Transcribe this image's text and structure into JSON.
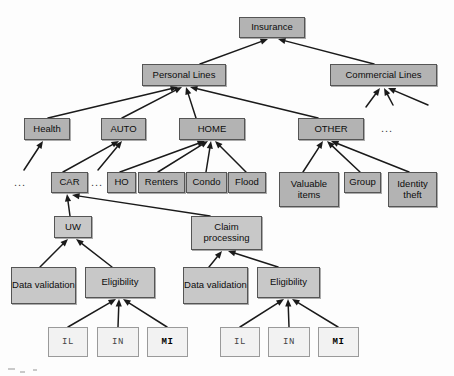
{
  "diagram": {
    "type": "tree-diagram",
    "colors": {
      "node_fill": "#b3b3b3",
      "node_fill_light": "#c8c8c8",
      "state_fill": "#f2f2f2",
      "border": "#555555",
      "edge": "#1a1a1a",
      "background": "#fdfdfd"
    },
    "nodes": [
      {
        "id": "insurance",
        "label": "Insurance",
        "x": 239,
        "y": 17,
        "w": 66,
        "h": 21,
        "shade": "shade-mid",
        "kind": "box"
      },
      {
        "id": "personal",
        "label": "Personal Lines",
        "x": 142,
        "y": 64,
        "w": 84,
        "h": 22,
        "shade": "shade-mid",
        "kind": "box"
      },
      {
        "id": "commercial",
        "label": "Commercial Lines",
        "x": 330,
        "y": 64,
        "w": 107,
        "h": 22,
        "shade": "shade-mid",
        "kind": "box"
      },
      {
        "id": "health",
        "label": "Health",
        "x": 24,
        "y": 118,
        "w": 46,
        "h": 22,
        "shade": "shade-mid",
        "kind": "box"
      },
      {
        "id": "auto",
        "label": "AUTO",
        "x": 101,
        "y": 118,
        "w": 45,
        "h": 22,
        "shade": "shade-mid",
        "kind": "box"
      },
      {
        "id": "home",
        "label": "HOME",
        "x": 179,
        "y": 118,
        "w": 66,
        "h": 22,
        "shade": "shade-mid",
        "kind": "box"
      },
      {
        "id": "other",
        "label": "OTHER",
        "x": 298,
        "y": 118,
        "w": 66,
        "h": 22,
        "shade": "shade-mid",
        "kind": "box"
      },
      {
        "id": "car",
        "label": "CAR",
        "x": 51,
        "y": 172,
        "w": 37,
        "h": 21,
        "shade": "shade-mid",
        "kind": "box"
      },
      {
        "id": "ho",
        "label": "HO",
        "x": 107,
        "y": 172,
        "w": 29,
        "h": 21,
        "shade": "shade-mid",
        "kind": "box"
      },
      {
        "id": "renters",
        "label": "Renters",
        "x": 138,
        "y": 172,
        "w": 47,
        "h": 21,
        "shade": "shade-mid",
        "kind": "box"
      },
      {
        "id": "condo",
        "label": "Condo",
        "x": 186,
        "y": 172,
        "w": 41,
        "h": 21,
        "shade": "shade-mid",
        "kind": "box"
      },
      {
        "id": "flood",
        "label": "Flood",
        "x": 228,
        "y": 172,
        "w": 38,
        "h": 21,
        "shade": "shade-mid",
        "kind": "box"
      },
      {
        "id": "valuable",
        "label": "Valuable items",
        "x": 279,
        "y": 172,
        "w": 60,
        "h": 35,
        "shade": "shade-mid",
        "kind": "box"
      },
      {
        "id": "group",
        "label": "Group",
        "x": 344,
        "y": 172,
        "w": 37,
        "h": 21,
        "shade": "shade-mid",
        "kind": "box"
      },
      {
        "id": "identity",
        "label": "Identity theft",
        "x": 388,
        "y": 172,
        "w": 49,
        "h": 35,
        "shade": "shade-mid",
        "kind": "box"
      },
      {
        "id": "uw",
        "label": "UW",
        "x": 54,
        "y": 216,
        "w": 38,
        "h": 22,
        "shade": "shade-light",
        "kind": "box"
      },
      {
        "id": "claim",
        "label": "Claim processing",
        "x": 191,
        "y": 216,
        "w": 71,
        "h": 34,
        "shade": "shade-light",
        "kind": "box"
      },
      {
        "id": "dv-left",
        "label": "Data validation",
        "x": 11,
        "y": 267,
        "w": 65,
        "h": 37,
        "shade": "shade-light",
        "kind": "box"
      },
      {
        "id": "elig-left",
        "label": "Eligibility",
        "x": 85,
        "y": 267,
        "w": 70,
        "h": 31,
        "shade": "shade-light",
        "kind": "box"
      },
      {
        "id": "dv-right",
        "label": "Data validation",
        "x": 183,
        "y": 267,
        "w": 65,
        "h": 37,
        "shade": "shade-light",
        "kind": "box"
      },
      {
        "id": "elig-right",
        "label": "Eligibility",
        "x": 257,
        "y": 267,
        "w": 63,
        "h": 31,
        "shade": "shade-light",
        "kind": "box"
      },
      {
        "id": "il-left",
        "label": "IL",
        "x": 48,
        "y": 327,
        "w": 40,
        "h": 30,
        "shade": "state",
        "kind": "state"
      },
      {
        "id": "in-left",
        "label": "IN",
        "x": 97,
        "y": 327,
        "w": 42,
        "h": 30,
        "shade": "state",
        "kind": "state"
      },
      {
        "id": "mi-left",
        "label": "MI",
        "x": 147,
        "y": 327,
        "w": 41,
        "h": 30,
        "shade": "state bold",
        "kind": "state"
      },
      {
        "id": "il-right",
        "label": "IL",
        "x": 220,
        "y": 327,
        "w": 40,
        "h": 30,
        "shade": "state",
        "kind": "state"
      },
      {
        "id": "in-right",
        "label": "IN",
        "x": 268,
        "y": 327,
        "w": 42,
        "h": 30,
        "shade": "state",
        "kind": "state"
      },
      {
        "id": "mi-right",
        "label": "MI",
        "x": 318,
        "y": 327,
        "w": 41,
        "h": 30,
        "shade": "state bold",
        "kind": "state"
      }
    ],
    "ellipses": [
      {
        "id": "ellipsis-other",
        "label": "...",
        "x": 381,
        "y": 122
      },
      {
        "id": "ellipsis-health",
        "label": "...",
        "x": 14,
        "y": 176
      },
      {
        "id": "ellipsis-car",
        "label": "...",
        "x": 91,
        "y": 176
      }
    ],
    "edges": [
      {
        "from": "personal",
        "to": "insurance",
        "x1": 200,
        "y1": 64,
        "x2": 268,
        "y2": 39
      },
      {
        "from": "commercial",
        "to": "insurance",
        "x1": 374,
        "y1": 64,
        "x2": 278,
        "y2": 39
      },
      {
        "from": "health",
        "to": "personal",
        "x1": 48,
        "y1": 118,
        "x2": 178,
        "y2": 87
      },
      {
        "from": "auto",
        "to": "personal",
        "x1": 122,
        "y1": 118,
        "x2": 182,
        "y2": 87
      },
      {
        "from": "home",
        "to": "personal",
        "x1": 196,
        "y1": 118,
        "x2": 186,
        "y2": 87
      },
      {
        "from": "other",
        "to": "personal",
        "x1": 318,
        "y1": 118,
        "x2": 190,
        "y2": 87
      },
      {
        "from": "car",
        "to": "auto",
        "x1": 63,
        "y1": 172,
        "x2": 119,
        "y2": 141
      },
      {
        "from": "dots-auto",
        "to": "auto",
        "x1": 98,
        "y1": 170,
        "x2": 122,
        "y2": 141
      },
      {
        "from": "ho",
        "to": "home",
        "x1": 120,
        "y1": 172,
        "x2": 205,
        "y2": 141
      },
      {
        "from": "renters",
        "to": "home",
        "x1": 158,
        "y1": 172,
        "x2": 208,
        "y2": 141
      },
      {
        "from": "condo",
        "to": "home",
        "x1": 206,
        "y1": 172,
        "x2": 211,
        "y2": 141
      },
      {
        "from": "flood",
        "to": "home",
        "x1": 246,
        "y1": 172,
        "x2": 215,
        "y2": 141
      },
      {
        "from": "valuable",
        "to": "other",
        "x1": 303,
        "y1": 172,
        "x2": 323,
        "y2": 141
      },
      {
        "from": "group",
        "to": "other",
        "x1": 360,
        "y1": 172,
        "x2": 327,
        "y2": 141
      },
      {
        "from": "identity",
        "to": "other",
        "x1": 409,
        "y1": 172,
        "x2": 331,
        "y2": 141
      },
      {
        "from": "dots-left",
        "to": "health",
        "x1": 24,
        "y1": 170,
        "x2": 43,
        "y2": 141
      },
      {
        "from": "uw",
        "to": "car",
        "x1": 70,
        "y1": 216,
        "x2": 67,
        "y2": 194
      },
      {
        "from": "claim",
        "to": "car",
        "x1": 210,
        "y1": 216,
        "x2": 72,
        "y2": 195
      },
      {
        "from": "dv-left",
        "to": "uw",
        "x1": 40,
        "y1": 267,
        "x2": 68,
        "y2": 239
      },
      {
        "from": "elig-left",
        "to": "uw",
        "x1": 112,
        "y1": 267,
        "x2": 76,
        "y2": 239
      },
      {
        "from": "dv-right",
        "to": "claim",
        "x1": 209,
        "y1": 267,
        "x2": 222,
        "y2": 251
      },
      {
        "from": "elig-right",
        "to": "claim",
        "x1": 278,
        "y1": 267,
        "x2": 228,
        "y2": 251
      },
      {
        "from": "il-left",
        "to": "elig-left",
        "x1": 68,
        "y1": 327,
        "x2": 116,
        "y2": 299
      },
      {
        "from": "in-left",
        "to": "elig-left",
        "x1": 118,
        "y1": 327,
        "x2": 119,
        "y2": 299
      },
      {
        "from": "mi-left",
        "to": "elig-left",
        "x1": 167,
        "y1": 327,
        "x2": 123,
        "y2": 299
      },
      {
        "from": "il-right",
        "to": "elig-right",
        "x1": 240,
        "y1": 327,
        "x2": 284,
        "y2": 299
      },
      {
        "from": "in-right",
        "to": "elig-right",
        "x1": 289,
        "y1": 327,
        "x2": 288,
        "y2": 299
      },
      {
        "from": "mi-right",
        "to": "elig-right",
        "x1": 338,
        "y1": 327,
        "x2": 292,
        "y2": 299
      },
      {
        "from": "comm-a",
        "to": "commercial",
        "x1": 366,
        "y1": 107,
        "x2": 380,
        "y2": 88
      },
      {
        "from": "comm-b",
        "to": "commercial",
        "x1": 393,
        "y1": 105,
        "x2": 384,
        "y2": 88
      },
      {
        "from": "comm-c",
        "to": "commercial",
        "x1": 428,
        "y1": 105,
        "x2": 388,
        "y2": 88
      }
    ]
  }
}
